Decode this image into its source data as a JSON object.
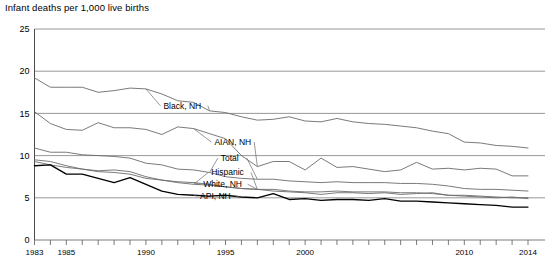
{
  "chart_data": {
    "type": "line",
    "title": "Infant deaths per 1,000 live births",
    "xlabel": "",
    "ylabel": "Infant deaths per 1,000 live births",
    "xlim": [
      1983,
      2014
    ],
    "ylim": [
      0,
      25
    ],
    "yticks": [
      0,
      5,
      10,
      15,
      20,
      25
    ],
    "ytick_labels": [
      "0",
      "5",
      "10",
      "15",
      "20",
      "25"
    ],
    "xticks": [
      1983,
      1984,
      1985,
      1986,
      1987,
      1988,
      1989,
      1990,
      1991,
      1992,
      1993,
      1994,
      1995,
      1996,
      1997,
      1998,
      1999,
      2000,
      2001,
      2002,
      2003,
      2004,
      2005,
      2006,
      2007,
      2008,
      2009,
      2010,
      2011,
      2012,
      2013,
      2014
    ],
    "xtick_labels_shown": [
      "1983",
      "1985",
      "1990",
      "1995",
      "2000",
      "2010",
      "2014"
    ],
    "xtick_label_years": [
      1983,
      1985,
      1990,
      1995,
      2000,
      2010,
      2014
    ],
    "grid": "horizontal",
    "legend": "inline-labels",
    "x": [
      1983,
      1984,
      1985,
      1986,
      1987,
      1988,
      1989,
      1990,
      1991,
      1992,
      1993,
      1994,
      1995,
      1996,
      1997,
      1998,
      1999,
      2000,
      2001,
      2002,
      2003,
      2004,
      2005,
      2006,
      2007,
      2008,
      2009,
      2010,
      2011,
      2012,
      2013,
      2014
    ],
    "series": [
      {
        "name": "Black, NH",
        "label": "Black, NH",
        "color": "#6b6b6b",
        "width": 0.9,
        "label_x": 1991.1,
        "label_y": 15.9,
        "values": [
          19.2,
          18.1,
          18.1,
          18.1,
          17.5,
          17.7,
          18.0,
          17.9,
          17.3,
          16.5,
          16.3,
          15.3,
          15.1,
          14.6,
          14.2,
          14.3,
          14.6,
          14.1,
          14.0,
          14.4,
          14.0,
          13.8,
          13.7,
          13.5,
          13.3,
          12.9,
          12.6,
          11.6,
          11.5,
          11.2,
          11.1,
          10.9
        ]
      },
      {
        "name": "AIAN, NH",
        "label": "AIAN, NH",
        "color": "#6b6b6b",
        "width": 0.9,
        "label_x": 1994.3,
        "label_y": 11.6,
        "values": [
          15.2,
          13.8,
          13.1,
          13.0,
          13.9,
          13.3,
          13.3,
          13.1,
          12.5,
          13.4,
          13.2,
          12.6,
          12.0,
          10.0,
          8.7,
          9.3,
          9.3,
          8.3,
          9.7,
          8.6,
          8.7,
          8.4,
          8.1,
          8.3,
          9.2,
          8.4,
          8.5,
          8.3,
          8.5,
          8.4,
          7.6,
          7.6
        ]
      },
      {
        "name": "Total",
        "label": "Total",
        "color": "#6b6b6b",
        "width": 0.9,
        "label_x": 1994.7,
        "label_y": 9.7,
        "values": [
          10.9,
          10.4,
          10.4,
          10.1,
          10.0,
          9.9,
          9.7,
          9.1,
          8.9,
          8.4,
          8.3,
          8.0,
          7.5,
          7.3,
          7.2,
          7.2,
          7.0,
          6.9,
          6.8,
          6.9,
          6.8,
          6.8,
          6.8,
          6.7,
          6.7,
          6.6,
          6.4,
          6.1,
          6.0,
          6.0,
          5.9,
          5.8
        ]
      },
      {
        "name": "Hispanic",
        "label": "Hispanic",
        "color": "#6b6b6b",
        "width": 0.9,
        "label_x": 1994.1,
        "label_y": 8.0,
        "values": [
          9.5,
          9.3,
          8.8,
          8.4,
          8.2,
          8.3,
          8.1,
          7.5,
          7.1,
          6.8,
          6.6,
          6.5,
          6.3,
          6.1,
          6.0,
          5.8,
          5.7,
          5.6,
          5.4,
          5.6,
          5.6,
          5.5,
          5.6,
          5.4,
          5.5,
          5.6,
          5.3,
          5.3,
          5.2,
          5.1,
          5.0,
          5.0
        ]
      },
      {
        "name": "White, NH",
        "label": "White, NH",
        "color": "#6b6b6b",
        "width": 0.9,
        "label_x": 1993.6,
        "label_y": 6.6,
        "values": [
          9.3,
          8.9,
          8.6,
          8.4,
          8.1,
          8.0,
          7.8,
          7.3,
          7.1,
          6.9,
          6.8,
          6.6,
          6.3,
          6.1,
          6.0,
          6.0,
          5.8,
          5.7,
          5.7,
          5.8,
          5.7,
          5.7,
          5.7,
          5.6,
          5.6,
          5.5,
          5.3,
          5.2,
          5.1,
          5.0,
          5.1,
          4.9
        ]
      },
      {
        "name": "API, NH",
        "label": "API, NH",
        "color": "#000000",
        "width": 1.35,
        "label_x": 1993.4,
        "label_y": 5.2,
        "values": [
          8.8,
          8.9,
          7.8,
          7.8,
          7.3,
          6.8,
          7.4,
          6.6,
          5.8,
          5.4,
          5.3,
          5.2,
          5.3,
          5.1,
          5.0,
          5.5,
          4.8,
          4.9,
          4.7,
          4.8,
          4.8,
          4.7,
          4.9,
          4.6,
          4.6,
          4.5,
          4.4,
          4.3,
          4.2,
          4.1,
          3.9,
          3.9
        ]
      }
    ]
  },
  "axis": {
    "y_axis_name": "y-axis",
    "x_axis_name": "x-axis"
  }
}
